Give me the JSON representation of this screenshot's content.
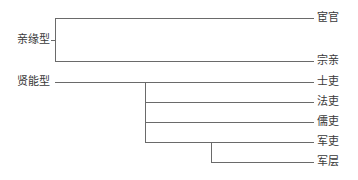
{
  "diagram": {
    "line_color": "#6a6a6a",
    "text_color": "#3a3a3a",
    "groups": [
      {
        "label": "亲缘型",
        "leaves": [
          "宦官",
          "宗亲"
        ]
      },
      {
        "label": "贤能型",
        "leaves": [
          "士吏",
          "法吏",
          "儒吏",
          "军吏",
          "军层"
        ]
      }
    ]
  }
}
